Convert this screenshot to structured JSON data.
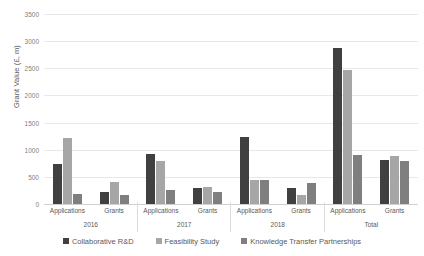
{
  "chart_data": {
    "type": "bar",
    "title": "",
    "subtitle": "",
    "xlabel": "",
    "ylabel": "Grant Value (£, m)",
    "ylim": [
      0,
      3500
    ],
    "ytick_step": 500,
    "yticks": [
      3500,
      3000,
      2500,
      2000,
      1500,
      1000,
      500,
      0
    ],
    "ytick_labels": [
      "3500",
      "3000",
      "2500",
      "2000",
      "1500",
      "1000",
      "500",
      "0"
    ],
    "grid": true,
    "grid_axis": "y",
    "legend_position": "bottom",
    "groups": [
      "2016",
      "2017",
      "2018",
      "Total"
    ],
    "subgroups": [
      "Applications",
      "Grants"
    ],
    "categories": [
      "2016 Applications",
      "2016 Grants",
      "2017 Applications",
      "2017 Grants",
      "2018 Applications",
      "2018 Grants",
      "Total Applications",
      "Total Grants"
    ],
    "series": [
      {
        "name": "Collaborative R&D",
        "color": "#404040",
        "values": [
          740,
          220,
          920,
          290,
          1230,
          300,
          2880,
          820
        ]
      },
      {
        "name": "Feasibility Study",
        "color": "#a6a6a6",
        "values": [
          1225,
          400,
          785,
          305,
          440,
          175,
          2460,
          890
        ]
      },
      {
        "name": "Knowledge Transfer Partnerships",
        "color": "#7f7f7f",
        "values": [
          185,
          160,
          255,
          225,
          445,
          385,
          895,
          790
        ]
      }
    ]
  },
  "legend": {
    "items": [
      {
        "label": "Collaborative R&D",
        "color": "#404040"
      },
      {
        "label": "Feasibility Study",
        "color": "#a6a6a6"
      },
      {
        "label": "Knowledge Transfer Partnerships",
        "color": "#7f7f7f"
      }
    ]
  },
  "colors": {
    "gridline": "#e8e8e8",
    "axis_text": "#595959",
    "tick_text": "#7f7f7f",
    "background": "#ffffff"
  }
}
